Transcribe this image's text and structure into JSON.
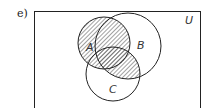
{
  "problem_label": "e)",
  "diagram": {
    "universe_label": "U",
    "sets": [
      {
        "name": "A",
        "label": "A"
      },
      {
        "name": "B",
        "label": "B"
      },
      {
        "name": "C",
        "label": "C"
      }
    ],
    "shaded_region": "A ∪ (B ∩ C)",
    "colors": {
      "stroke": "#222222",
      "hatch": "#444444",
      "background": "#ffffff"
    }
  }
}
